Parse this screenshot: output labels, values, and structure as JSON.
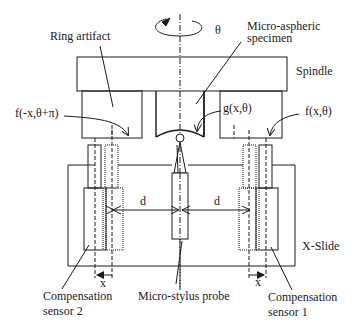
{
  "labels": {
    "theta": "θ",
    "ring_artifact": "Ring artifact",
    "micro_aspheric_1": "Micro-aspheric",
    "micro_aspheric_2": "specimen",
    "spindle": "Spindle",
    "f_left": "f(-x,θ+π)",
    "g_center": "g(x,θ)",
    "f_right": "f(x,θ)",
    "d_left": "d",
    "d_right": "d",
    "x_slide": "X-Slide",
    "x_left": "x",
    "x_right": "x",
    "comp2_line1": "Compensation",
    "comp2_line2": "sensor 2",
    "probe": "Micro-stylus probe",
    "comp1_line1": "Compensation",
    "comp1_line2": "sensor 1"
  },
  "colors": {
    "stroke": "#1a1a1a",
    "background": "#ffffff"
  }
}
